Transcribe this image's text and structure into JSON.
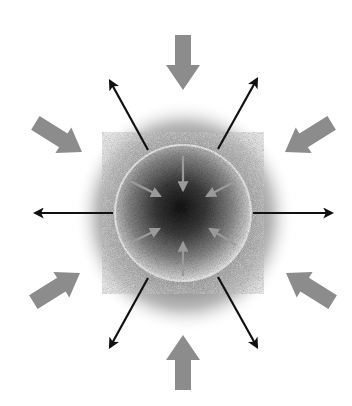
{
  "diagram": {
    "title": "Spherical body with inward pressure and outward radiation",
    "colors": {
      "background": "#ffffff",
      "inward_arrow": "#8c8c8c",
      "inner_arrow": "#9a9a9a",
      "outward_arrow": "#111111",
      "halo_outer": "#ffffff",
      "halo_inner": "#6e6e6e",
      "core_center": "#151515",
      "core_edge": "#d8d8d8",
      "core_rim": "#f4f4f4"
    },
    "sphere": {
      "cx": 183,
      "cy": 213,
      "r": 67
    },
    "halo": {
      "cx": 183,
      "cy": 215,
      "rx": 108,
      "ry": 115
    },
    "outward_arrows": [
      {
        "name": "left",
        "x1": 113,
        "y1": 213,
        "x2": 33,
        "y2": 213
      },
      {
        "name": "right",
        "x1": 253,
        "y1": 213,
        "x2": 334,
        "y2": 213
      },
      {
        "name": "upper-left",
        "x1": 148,
        "y1": 150,
        "x2": 108,
        "y2": 78
      },
      {
        "name": "upper-right",
        "x1": 218,
        "y1": 149,
        "x2": 259,
        "y2": 76
      },
      {
        "name": "lower-left",
        "x1": 148,
        "y1": 278,
        "x2": 109,
        "y2": 350
      },
      {
        "name": "lower-right",
        "x1": 218,
        "y1": 277,
        "x2": 258,
        "y2": 350
      }
    ],
    "inward_block_arrows": [
      {
        "name": "top",
        "tx": 183,
        "ty": 90,
        "angle": 90
      },
      {
        "name": "bottom",
        "tx": 183,
        "ty": 335,
        "angle": 270
      },
      {
        "name": "upper-left",
        "tx": 82,
        "ty": 152,
        "angle": 30
      },
      {
        "name": "upper-right",
        "tx": 285,
        "ty": 152,
        "angle": 150
      },
      {
        "name": "lower-left",
        "tx": 82,
        "ty": 272,
        "angle": 330
      },
      {
        "name": "lower-right",
        "tx": 285,
        "ty": 272,
        "angle": 210
      }
    ],
    "inner_arrows": [
      {
        "name": "top",
        "x1": 183,
        "y1": 156,
        "x2": 183,
        "y2": 190
      },
      {
        "name": "bottom",
        "x1": 183,
        "y1": 276,
        "x2": 183,
        "y2": 243
      },
      {
        "name": "upper-left",
        "x1": 130,
        "y1": 181,
        "x2": 160,
        "y2": 196
      },
      {
        "name": "upper-right",
        "x1": 236,
        "y1": 181,
        "x2": 207,
        "y2": 196
      },
      {
        "name": "lower-left",
        "x1": 130,
        "y1": 243,
        "x2": 159,
        "y2": 229
      },
      {
        "name": "lower-right",
        "x1": 236,
        "y1": 245,
        "x2": 210,
        "y2": 229
      }
    ]
  }
}
